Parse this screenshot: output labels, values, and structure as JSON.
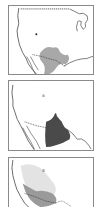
{
  "figure": {
    "panels": [
      {
        "id": "map-1",
        "region": "western United States and northern Mexico",
        "shading": [
          {
            "tone": "medium-gray",
            "color": "#a8a8a8"
          }
        ]
      },
      {
        "id": "map-2",
        "region": "western Mexico and southwestern US border",
        "shading": [
          {
            "tone": "dark-gray",
            "color": "#4a4a4a"
          }
        ]
      },
      {
        "id": "map-3",
        "region": "Baja California and northwestern Mexico",
        "shading": [
          {
            "tone": "light-gray",
            "color": "#e3e3e3"
          },
          {
            "tone": "medium-gray",
            "color": "#9a9a9a"
          }
        ]
      }
    ],
    "colors": {
      "frame": "#8a8a8a",
      "coastline": "#444444",
      "border_dotted": "#333333",
      "background": "#ffffff"
    }
  }
}
